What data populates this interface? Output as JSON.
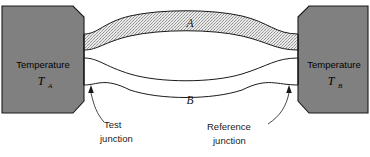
{
  "figure": {
    "kind": "thermocouple-schematic",
    "background": "#ffffff"
  },
  "blocks": {
    "left": {
      "label": "Temperature",
      "symbol": "T",
      "subscript": "A",
      "fill": "#808080",
      "stroke": "#1a1a1a"
    },
    "right": {
      "label": "Temperature",
      "symbol": "T",
      "subscript": "B",
      "fill": "#808080",
      "stroke": "#1a1a1a"
    }
  },
  "conductors": [
    {
      "label": "A",
      "position": "upper",
      "fill": "stippled-gray",
      "fill_color": "#d4d4d4",
      "stroke": "#1a1a1a"
    },
    {
      "label": "B",
      "position": "lower",
      "fill": "white",
      "fill_color": "#ffffff",
      "stroke": "#1a1a1a"
    }
  ],
  "callouts": [
    {
      "line1": "Test",
      "line2": "junction",
      "side": "left"
    },
    {
      "line1": "Reference",
      "line2": "junction",
      "side": "right"
    }
  ]
}
